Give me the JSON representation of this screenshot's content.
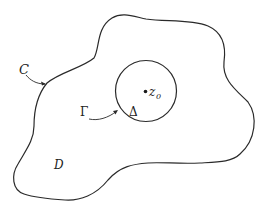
{
  "diagram": {
    "labels": {
      "outer_contour": "C",
      "inner_circle": "Γ",
      "disk": "Δ",
      "point": "z",
      "point_subscript": "0",
      "region": "D"
    },
    "colors": {
      "stroke": "#2a2a2a",
      "background": "#ffffff",
      "text": "#222222"
    }
  }
}
